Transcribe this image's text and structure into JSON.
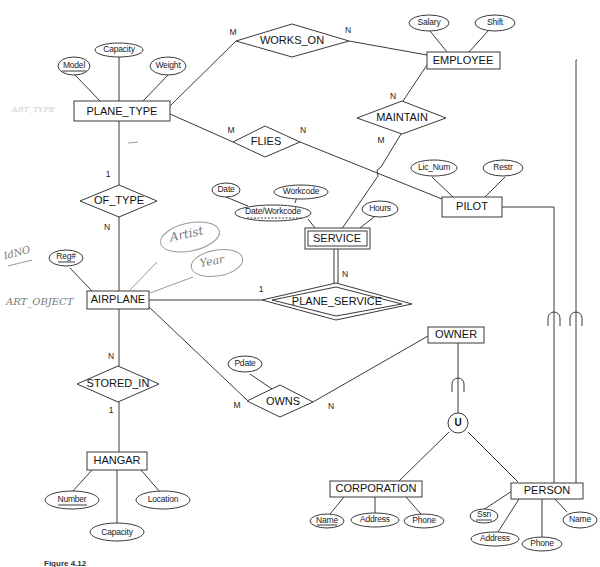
{
  "diagram": {
    "type": "EER diagram",
    "entities": {
      "plane_type": "PLANE_TYPE",
      "employee": "EMPLOYEE",
      "pilot": "PILOT",
      "airplane": "AIRPLANE",
      "hangar": "HANGAR",
      "owner": "OWNER",
      "corporation": "CORPORATION",
      "person": "PERSON",
      "service": "SERVICE"
    },
    "relationships": {
      "works_on": "WORKS_ON",
      "flies": "FLIES",
      "maintain": "MAINTAIN",
      "of_type": "OF_TYPE",
      "plane_service": "PLANE_SERVICE",
      "stored_in": "STORED_IN",
      "owns": "OWNS"
    },
    "attributes": {
      "plane_type_model": "Model",
      "plane_type_capacity": "Capacity",
      "plane_type_weight": "Weight",
      "employee_salary": "Salary",
      "employee_shift": "Shift",
      "pilot_lic_num": "Lic_Num",
      "pilot_restr": "Restr",
      "service_date": "Date",
      "service_workcode": "Workcode",
      "service_date_workcode": "Date/Workcode",
      "service_hours": "Hours",
      "airplane_reg": "Reg#",
      "owns_pdate": "Pdate",
      "hangar_number": "Number",
      "hangar_capacity": "Capacity",
      "hangar_location": "Location",
      "corporation_name": "Name",
      "corporation_address": "Address",
      "corporation_phone": "Phone",
      "person_ssn": "Ssn",
      "person_address": "Address",
      "person_phone": "Phone",
      "person_name": "Name"
    },
    "cardinalities": {
      "works_on_plane_type": "M",
      "works_on_employee": "N",
      "flies_plane_type": "M",
      "flies_pilot": "N",
      "maintain_employee": "N",
      "maintain_service": "M",
      "of_type_plane_type": "1",
      "of_type_airplane": "N",
      "plane_service_airplane": "1",
      "plane_service_service": "N",
      "stored_in_airplane": "N",
      "stored_in_hangar": "1",
      "owns_airplane": "M",
      "owns_owner": "N"
    },
    "union_symbol": "U",
    "handwritten": {
      "faint_plane_type_note": "ART_TYPE",
      "idno": "IdNO",
      "art_object": "ART_OBJECT",
      "artist": "Artist",
      "year": "Year"
    },
    "caption": "Figure 4.12"
  }
}
